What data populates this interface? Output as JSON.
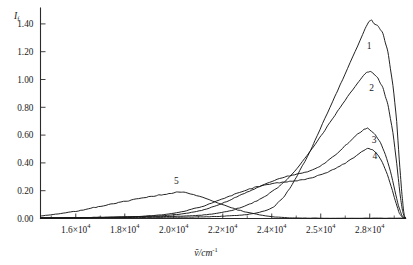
{
  "chart_data": {
    "type": "line",
    "title": "",
    "xlabel": "ṽ/cm⁻¹",
    "ylabel": "I_f",
    "ylabel_base": "I",
    "ylabel_sub": "f",
    "xlabel_base": "ṽ/cm",
    "xlabel_exp": "-1",
    "grid": false,
    "legend_position": "inline-curve-labels",
    "xlim": [
      15000,
      29500
    ],
    "ylim": [
      0.0,
      1.5
    ],
    "x_tick_labels": [
      "1.6×10⁴",
      "1.8×10⁴",
      "2.0×10⁴",
      "2.2×10⁴",
      "2.4×10⁴",
      "2.5×10⁴",
      "2.8×10⁴"
    ],
    "x_tick_mantissas": [
      "1.6",
      "1.8",
      "2.0",
      "2.2",
      "2.4",
      "2.5",
      "2.8"
    ],
    "x_tick_multiplier": "×10",
    "x_tick_exponent": "4",
    "x_tick_values": [
      16000,
      18000,
      20000,
      22000,
      24000,
      26000,
      28000
    ],
    "y_tick_labels": [
      "0.00",
      "0.20",
      "0.40",
      "0.60",
      "0.80",
      "1.00",
      "1.20",
      "1.40"
    ],
    "y_tick_values": [
      0.0,
      0.2,
      0.4,
      0.6,
      0.8,
      1.0,
      1.2,
      1.4
    ],
    "curve_color": "#171717",
    "series": [
      {
        "name": "1",
        "label": "1",
        "label_x": 28050,
        "label_y": 1.22,
        "peak_x": 28150,
        "peak_y": 1.43,
        "points": [
          [
            15000,
            0.005
          ],
          [
            16000,
            0.005
          ],
          [
            17000,
            0.006
          ],
          [
            18000,
            0.007
          ],
          [
            19000,
            0.008
          ],
          [
            20000,
            0.009
          ],
          [
            21000,
            0.01
          ],
          [
            21600,
            0.012
          ],
          [
            22000,
            0.014
          ],
          [
            22400,
            0.018
          ],
          [
            22800,
            0.022
          ],
          [
            23200,
            0.028
          ],
          [
            23600,
            0.04
          ],
          [
            24000,
            0.06
          ],
          [
            24300,
            0.09
          ],
          [
            24600,
            0.14
          ],
          [
            24900,
            0.215
          ],
          [
            25200,
            0.31
          ],
          [
            25500,
            0.41
          ],
          [
            25800,
            0.52
          ],
          [
            26100,
            0.64
          ],
          [
            26400,
            0.76
          ],
          [
            26700,
            0.88
          ],
          [
            27000,
            1.0
          ],
          [
            27300,
            1.12
          ],
          [
            27600,
            1.24
          ],
          [
            27900,
            1.37
          ],
          [
            28050,
            1.415
          ],
          [
            28150,
            1.43
          ],
          [
            28250,
            1.4
          ],
          [
            28400,
            1.39
          ],
          [
            28600,
            1.33
          ],
          [
            28800,
            1.2
          ],
          [
            29000,
            0.96
          ],
          [
            29150,
            0.7
          ],
          [
            29250,
            0.43
          ],
          [
            29350,
            0.19
          ],
          [
            29420,
            0.06
          ],
          [
            29470,
            0.012
          ],
          [
            29500,
            0.005
          ]
        ]
      },
      {
        "name": "2",
        "label": "2",
        "label_x": 28150,
        "label_y": 0.92,
        "peak_x": 28100,
        "peak_y": 1.06,
        "points": [
          [
            15000,
            0.005
          ],
          [
            16000,
            0.006
          ],
          [
            17000,
            0.007
          ],
          [
            18000,
            0.009
          ],
          [
            19000,
            0.011
          ],
          [
            20000,
            0.014
          ],
          [
            20800,
            0.018
          ],
          [
            21400,
            0.024
          ],
          [
            21800,
            0.032
          ],
          [
            22200,
            0.044
          ],
          [
            22600,
            0.06
          ],
          [
            23000,
            0.082
          ],
          [
            23400,
            0.11
          ],
          [
            23800,
            0.145
          ],
          [
            24100,
            0.18
          ],
          [
            24400,
            0.22
          ],
          [
            24700,
            0.265
          ],
          [
            25000,
            0.32
          ],
          [
            25300,
            0.385
          ],
          [
            25600,
            0.455
          ],
          [
            25900,
            0.53
          ],
          [
            26200,
            0.61
          ],
          [
            26500,
            0.69
          ],
          [
            26800,
            0.77
          ],
          [
            27100,
            0.85
          ],
          [
            27400,
            0.925
          ],
          [
            27700,
            1.0
          ],
          [
            27950,
            1.05
          ],
          [
            28100,
            1.06
          ],
          [
            28250,
            1.04
          ],
          [
            28400,
            1.01
          ],
          [
            28600,
            0.94
          ],
          [
            28800,
            0.82
          ],
          [
            29000,
            0.62
          ],
          [
            29150,
            0.4
          ],
          [
            29280,
            0.18
          ],
          [
            29380,
            0.055
          ],
          [
            29450,
            0.012
          ],
          [
            29500,
            0.004
          ]
        ]
      },
      {
        "name": "3",
        "label": "3",
        "label_x": 28250,
        "label_y": 0.545,
        "peak_x": 28000,
        "peak_y": 0.65,
        "points": [
          [
            15000,
            0.004
          ],
          [
            16500,
            0.006
          ],
          [
            18000,
            0.01
          ],
          [
            19000,
            0.014
          ],
          [
            19800,
            0.02
          ],
          [
            20400,
            0.028
          ],
          [
            20900,
            0.04
          ],
          [
            21300,
            0.055
          ],
          [
            21700,
            0.075
          ],
          [
            22100,
            0.1
          ],
          [
            22500,
            0.13
          ],
          [
            22900,
            0.163
          ],
          [
            23300,
            0.196
          ],
          [
            23700,
            0.228
          ],
          [
            24000,
            0.252
          ],
          [
            24300,
            0.274
          ],
          [
            24600,
            0.292
          ],
          [
            24900,
            0.308
          ],
          [
            25200,
            0.322
          ],
          [
            25500,
            0.333
          ],
          [
            25800,
            0.348
          ],
          [
            26100,
            0.375
          ],
          [
            26400,
            0.412
          ],
          [
            26700,
            0.455
          ],
          [
            27000,
            0.505
          ],
          [
            27300,
            0.558
          ],
          [
            27600,
            0.608
          ],
          [
            27850,
            0.64
          ],
          [
            28000,
            0.65
          ],
          [
            28150,
            0.628
          ],
          [
            28300,
            0.6
          ],
          [
            28500,
            0.545
          ],
          [
            28700,
            0.46
          ],
          [
            28900,
            0.34
          ],
          [
            29080,
            0.2
          ],
          [
            29220,
            0.09
          ],
          [
            29350,
            0.025
          ],
          [
            29440,
            0.006
          ],
          [
            29500,
            0.003
          ]
        ]
      },
      {
        "name": "4",
        "label": "4",
        "label_x": 28280,
        "label_y": 0.425,
        "peak_x": 28050,
        "peak_y": 0.505,
        "points": [
          [
            15000,
            0.003
          ],
          [
            16000,
            0.004
          ],
          [
            17000,
            0.006
          ],
          [
            18000,
            0.009
          ],
          [
            18800,
            0.014
          ],
          [
            19400,
            0.02
          ],
          [
            19900,
            0.028
          ],
          [
            20300,
            0.038
          ],
          [
            20700,
            0.052
          ],
          [
            21100,
            0.07
          ],
          [
            21500,
            0.092
          ],
          [
            21900,
            0.118
          ],
          [
            22300,
            0.146
          ],
          [
            22700,
            0.174
          ],
          [
            23100,
            0.2
          ],
          [
            23500,
            0.222
          ],
          [
            23900,
            0.24
          ],
          [
            24300,
            0.253
          ],
          [
            24700,
            0.262
          ],
          [
            25100,
            0.27
          ],
          [
            25500,
            0.282
          ],
          [
            25900,
            0.3
          ],
          [
            26300,
            0.325
          ],
          [
            26700,
            0.358
          ],
          [
            27100,
            0.398
          ],
          [
            27450,
            0.44
          ],
          [
            27750,
            0.48
          ],
          [
            27950,
            0.5
          ],
          [
            28050,
            0.505
          ],
          [
            28200,
            0.492
          ],
          [
            28380,
            0.462
          ],
          [
            28580,
            0.405
          ],
          [
            28780,
            0.315
          ],
          [
            28980,
            0.2
          ],
          [
            29130,
            0.105
          ],
          [
            29260,
            0.035
          ],
          [
            29380,
            0.008
          ],
          [
            29500,
            0.003
          ]
        ]
      },
      {
        "name": "5",
        "label": "5",
        "label_x": 20400,
        "label_y": 0.245,
        "peak_x": 20500,
        "peak_y": 0.19,
        "points": [
          [
            15000,
            0.018
          ],
          [
            15300,
            0.024
          ],
          [
            15700,
            0.033
          ],
          [
            16100,
            0.044
          ],
          [
            16500,
            0.056
          ],
          [
            16900,
            0.07
          ],
          [
            17300,
            0.085
          ],
          [
            17700,
            0.1
          ],
          [
            18100,
            0.114
          ],
          [
            18500,
            0.128
          ],
          [
            18900,
            0.142
          ],
          [
            19300,
            0.155
          ],
          [
            19700,
            0.168
          ],
          [
            20000,
            0.176
          ],
          [
            20300,
            0.186
          ],
          [
            20500,
            0.19
          ],
          [
            20700,
            0.187
          ],
          [
            20950,
            0.178
          ],
          [
            21200,
            0.165
          ],
          [
            21450,
            0.15
          ],
          [
            21700,
            0.133
          ],
          [
            21950,
            0.116
          ],
          [
            22200,
            0.1
          ],
          [
            22450,
            0.085
          ],
          [
            22700,
            0.07
          ],
          [
            22950,
            0.057
          ],
          [
            23200,
            0.046
          ],
          [
            23450,
            0.036
          ],
          [
            23700,
            0.027
          ],
          [
            23950,
            0.019
          ],
          [
            24200,
            0.013
          ],
          [
            24450,
            0.009
          ],
          [
            24700,
            0.006
          ],
          [
            25000,
            0.004
          ],
          [
            25500,
            0.003
          ],
          [
            26500,
            0.002
          ],
          [
            28000,
            0.002
          ],
          [
            29500,
            0.002
          ]
        ]
      }
    ]
  }
}
